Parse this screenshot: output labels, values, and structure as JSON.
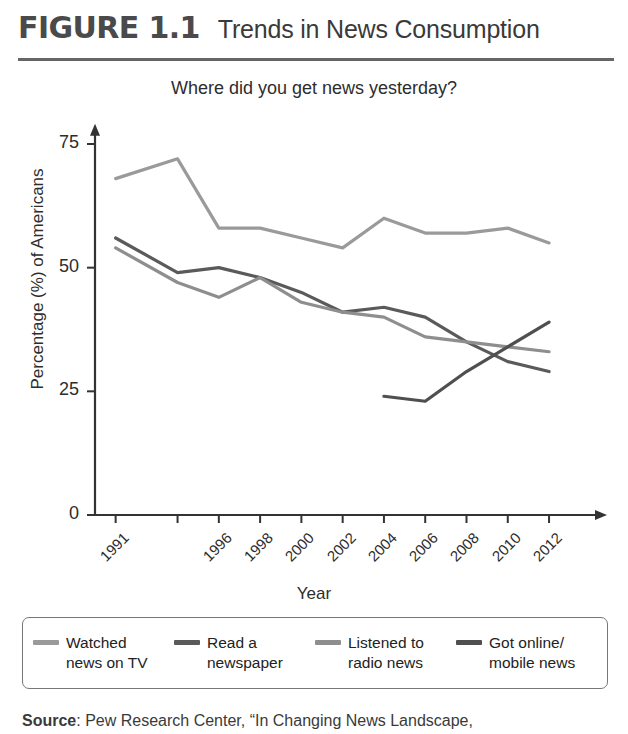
{
  "figure": {
    "number": "FIGURE 1.1",
    "title": "Trends in News Consumption"
  },
  "source": {
    "label": "Source",
    "text": ": Pew Research Center, “In Changing News Landscape,"
  },
  "legend": {
    "items": [
      {
        "label": "Watched\nnews on TV",
        "color": "#9a9a9a",
        "key": "tv"
      },
      {
        "label": "Read a\nnewspaper",
        "color": "#5a5a5a",
        "key": "newspaper"
      },
      {
        "label": "Listened to\nradio news",
        "color": "#8e8e8e",
        "key": "radio"
      },
      {
        "label": "Got online/\nmobile news",
        "color": "#4f4f4f",
        "key": "online"
      }
    ]
  },
  "chart_data": {
    "type": "line",
    "title": "Where did you get news yesterday?",
    "xlabel": "Year",
    "ylabel": "Percentage (%) of Americans",
    "x": [
      1991,
      1994,
      1996,
      1998,
      2000,
      2002,
      2004,
      2006,
      2008,
      2010,
      2012
    ],
    "xtick_labels": [
      "1991",
      "",
      "1996",
      "1998",
      "2000",
      "2002",
      "2004",
      "2006",
      "2008",
      "2010",
      "2012"
    ],
    "ytick_labels": [
      "0",
      "25",
      "50",
      "75"
    ],
    "yticks": [
      0,
      25,
      50,
      75
    ],
    "ylim": [
      0,
      80
    ],
    "xlim": [
      1990,
      2013.5
    ],
    "grid": false,
    "legend_position": "bottom",
    "series": [
      {
        "name": "Watched news on TV",
        "color": "#9a9a9a",
        "x": [
          1991,
          1994,
          1996,
          1998,
          2000,
          2002,
          2004,
          2006,
          2008,
          2010,
          2012
        ],
        "values": [
          68,
          72,
          58,
          58,
          56,
          54,
          60,
          57,
          57,
          58,
          55
        ]
      },
      {
        "name": "Read a newspaper",
        "color": "#5a5a5a",
        "x": [
          1991,
          1994,
          1996,
          1998,
          2000,
          2002,
          2004,
          2006,
          2008,
          2010,
          2012
        ],
        "values": [
          56,
          49,
          50,
          48,
          45,
          41,
          42,
          40,
          35,
          31,
          29
        ]
      },
      {
        "name": "Listened to radio news",
        "color": "#8e8e8e",
        "x": [
          1991,
          1994,
          1996,
          1998,
          2000,
          2002,
          2004,
          2006,
          2008,
          2010,
          2012
        ],
        "values": [
          54,
          47,
          44,
          48,
          43,
          41,
          40,
          36,
          35,
          34,
          33
        ]
      },
      {
        "name": "Got online/mobile news",
        "color": "#4f4f4f",
        "x": [
          2004,
          2006,
          2008,
          2010,
          2012
        ],
        "values": [
          24,
          23,
          29,
          34,
          39
        ]
      }
    ]
  }
}
